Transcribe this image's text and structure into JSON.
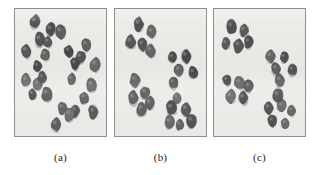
{
  "figure": {
    "type": "spatial-point-pattern-panels",
    "background_color": "#ffffff",
    "panel_background_color": "#edebe8",
    "panel_border_color": "#8d8d8d",
    "dot_color": "#585858",
    "dot_edge_color": "#3d3d3d",
    "dot_highlight_color": "#8a8a8a"
  },
  "chart_data": {
    "type": "scatter",
    "title": "",
    "xlabel": "",
    "ylabel": "",
    "xlim": [
      0,
      100
    ],
    "ylim": [
      0,
      100
    ],
    "grid": false,
    "legend": null,
    "axes_visible": false,
    "marker": "filled-dark-blob",
    "panels": [
      {
        "label": "(a)",
        "pattern": "random",
        "n_points": 26,
        "points": [
          [
            22,
            90
          ],
          [
            39,
            84
          ],
          [
            27,
            76
          ],
          [
            36,
            74
          ],
          [
            50,
            82
          ],
          [
            12,
            67
          ],
          [
            33,
            64
          ],
          [
            59,
            67
          ],
          [
            78,
            72
          ],
          [
            25,
            55
          ],
          [
            72,
            62
          ],
          [
            66,
            57
          ],
          [
            88,
            56
          ],
          [
            12,
            44
          ],
          [
            62,
            45
          ],
          [
            25,
            41
          ],
          [
            84,
            40
          ],
          [
            19,
            33
          ],
          [
            35,
            33
          ],
          [
            76,
            30
          ],
          [
            52,
            22
          ],
          [
            66,
            20
          ],
          [
            60,
            17
          ],
          [
            86,
            19
          ],
          [
            45,
            9
          ],
          [
            30,
            46
          ]
        ]
      },
      {
        "label": "(b)",
        "pattern": "clustered",
        "n_points": 22,
        "n_clusters": 4,
        "clusters": [
          {
            "center": [
              28,
              78
            ],
            "points": [
              [
                26,
                88
              ],
              [
                40,
                82
              ],
              [
                17,
                74
              ],
              [
                30,
                72
              ],
              [
                39,
                67
              ]
            ]
          },
          {
            "center": [
              70,
              55
            ],
            "points": [
              [
                63,
                62
              ],
              [
                78,
                63
              ],
              [
                70,
                52
              ],
              [
                86,
                50
              ],
              [
                64,
                42
              ]
            ]
          },
          {
            "center": [
              26,
              33
            ],
            "points": [
              [
                22,
                44
              ],
              [
                33,
                34
              ],
              [
                20,
                30
              ],
              [
                38,
                26
              ],
              [
                29,
                21
              ]
            ]
          },
          {
            "center": [
              70,
              16
            ],
            "points": [
              [
                62,
                22
              ],
              [
                78,
                21
              ],
              [
                60,
                11
              ],
              [
                71,
                9
              ],
              [
                84,
                12
              ],
              [
                68,
                30
              ]
            ]
          }
        ]
      },
      {
        "label": "(c)",
        "pattern": "clustered",
        "n_points": 23,
        "n_clusters": 4,
        "clusters": [
          {
            "center": [
              25,
              78
            ],
            "points": [
              [
                19,
                86
              ],
              [
                33,
                83
              ],
              [
                13,
                73
              ],
              [
                27,
                71
              ],
              [
                38,
                74
              ]
            ]
          },
          {
            "center": [
              72,
              58
            ],
            "points": [
              [
                62,
                63
              ],
              [
                77,
                62
              ],
              [
                68,
                53
              ],
              [
                86,
                52
              ],
              [
                72,
                44
              ]
            ]
          },
          {
            "center": [
              24,
              37
            ],
            "points": [
              [
                14,
                44
              ],
              [
                28,
                42
              ],
              [
                18,
                31
              ],
              [
                32,
                30
              ],
              [
                38,
                39
              ]
            ]
          },
          {
            "center": [
              72,
              17
            ],
            "points": [
              [
                60,
                22
              ],
              [
                74,
                24
              ],
              [
                85,
                20
              ],
              [
                64,
                12
              ],
              [
                78,
                10
              ],
              [
                70,
                32
              ]
            ]
          }
        ]
      }
    ]
  },
  "captions": {
    "panel_a": "(a)",
    "panel_b": "(b)",
    "panel_c": "(c)"
  }
}
